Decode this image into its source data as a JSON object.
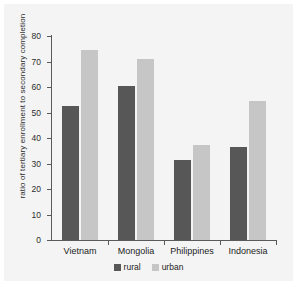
{
  "chart_data": {
    "type": "bar",
    "title": "",
    "xlabel": "",
    "ylabel": "ratio of tertiary enrollment to secondary completion",
    "categories": [
      "Vietnam",
      "Mongolia",
      "Philippines",
      "Indonesia"
    ],
    "series": [
      {
        "name": "rural",
        "color": "#575757",
        "values": [
          52.5,
          60.5,
          31.3,
          36.5
        ]
      },
      {
        "name": "urban",
        "color": "#c6c6c6",
        "values": [
          74.5,
          71.0,
          37.3,
          54.7
        ]
      }
    ],
    "ylim": [
      0,
      80
    ],
    "yticks": [
      0,
      10,
      20,
      30,
      40,
      50,
      60,
      70,
      80
    ],
    "ytick_labels": [
      "0",
      "10",
      "20",
      "30",
      "40",
      "50",
      "60",
      "70",
      "80"
    ],
    "grid": false,
    "legend_position": "bottom-center",
    "legend_entries": [
      "rural",
      "urban"
    ],
    "background_color": "#f4f4f4",
    "axis_color": "#5a5a5a"
  }
}
